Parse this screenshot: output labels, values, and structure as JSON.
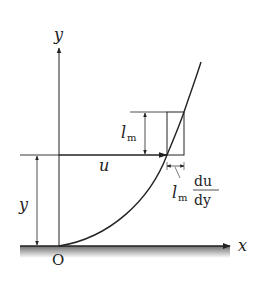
{
  "diagram": {
    "axes": {
      "x_label": "x",
      "y_label": "y",
      "origin_label": "O"
    },
    "labels": {
      "velocity": "u",
      "height": "y",
      "mixing_length": "l",
      "mixing_length_sub": "m",
      "fluctuation_prefix": "l",
      "fluctuation_sub": "m",
      "fluctuation_num": "du",
      "fluctuation_den": "dy"
    },
    "colors": {
      "ink": "#222222",
      "wall": "#8a8a8a"
    }
  }
}
